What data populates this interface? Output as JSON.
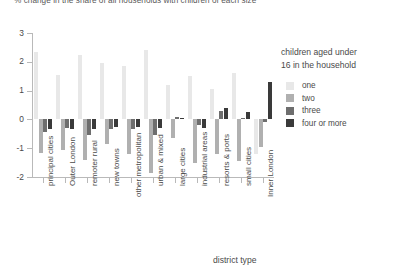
{
  "chart_data": {
    "type": "bar",
    "title": "% change in the share of all households with children of each size",
    "xlabel": "district type",
    "ylabel": "",
    "ylim": [
      -2,
      3
    ],
    "yticks": [
      3,
      2,
      1,
      0,
      -1,
      -2
    ],
    "ytick_labels": [
      "3",
      "2",
      "1",
      "0",
      "-1",
      "-2"
    ],
    "grid": false,
    "legend_position": "right",
    "legend_title_lines": [
      "children aged under",
      "16 in the household"
    ],
    "categories": [
      "principal cities",
      "Outer London",
      "remoter rural",
      "new towns",
      "other metropolitan",
      "urban & mixed",
      "large cities",
      "industrial areas",
      "resorts & ports",
      "small cities",
      "Inner London"
    ],
    "series": [
      {
        "name": "one",
        "color": "#e8e8e8",
        "values": [
          2.35,
          1.55,
          2.25,
          1.95,
          1.85,
          2.4,
          1.2,
          1.5,
          1.05,
          1.6,
          -1.2
        ]
      },
      {
        "name": "two",
        "color": "#b0b0b0",
        "values": [
          -1.15,
          -1.05,
          -1.4,
          -0.85,
          -1.2,
          -1.85,
          -0.65,
          -1.5,
          -1.2,
          -1.45,
          -0.95
        ]
      },
      {
        "name": "three",
        "color": "#6e6e6e",
        "values": [
          -0.45,
          -0.3,
          -0.55,
          -0.35,
          -0.35,
          -0.55,
          0.1,
          -0.2,
          0.3,
          0.05,
          -0.1
        ]
      },
      {
        "name": "four or more",
        "color": "#3a3a3a",
        "values": [
          -0.35,
          -0.35,
          -0.35,
          -0.25,
          -0.25,
          -0.3,
          0.05,
          -0.3,
          0.4,
          0.25,
          1.3
        ]
      }
    ]
  }
}
